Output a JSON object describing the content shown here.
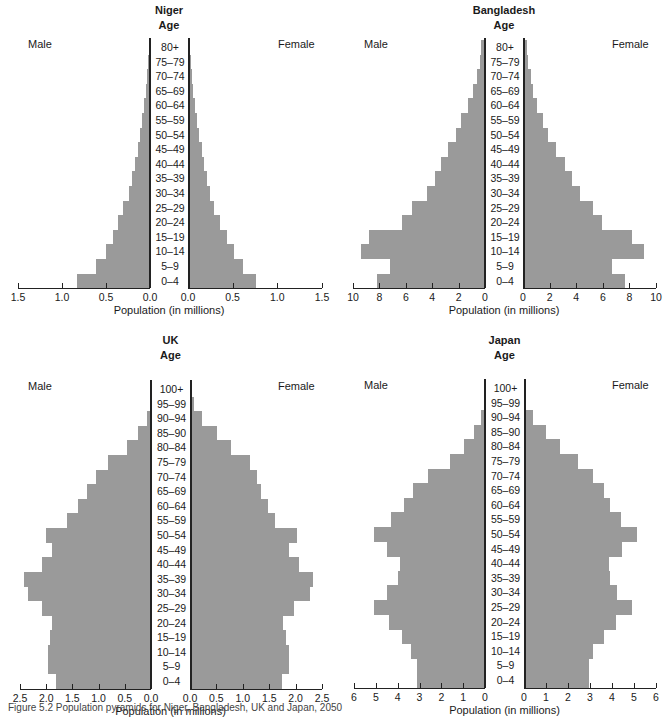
{
  "chart_data": [
    {
      "type": "bar",
      "orientation": "horizontal",
      "subtype": "population-pyramid",
      "title": "Niger",
      "age_label": "Age",
      "left_label": "Male",
      "right_label": "Female",
      "xlabel": "Population (in millions)",
      "xlim": [
        0,
        1.5
      ],
      "xticks": [
        "1.5",
        "1.0",
        "0.5",
        "0.0"
      ],
      "xticks_right": [
        "0.0",
        "0.5",
        "1.0",
        "1.5"
      ],
      "categories": [
        "80+",
        "75–79",
        "70–74",
        "65–69",
        "60–64",
        "55–59",
        "50–54",
        "45–49",
        "40–44",
        "35–39",
        "30–34",
        "25–29",
        "20–24",
        "15–19",
        "10–14",
        "5–9",
        "0–4"
      ],
      "series": [
        {
          "name": "Male",
          "values": [
            0.01,
            0.02,
            0.03,
            0.05,
            0.07,
            0.09,
            0.11,
            0.14,
            0.17,
            0.2,
            0.24,
            0.31,
            0.36,
            0.42,
            0.5,
            0.61,
            0.83,
            1.06
          ]
        },
        {
          "name": "Female",
          "values": [
            0.01,
            0.02,
            0.03,
            0.05,
            0.07,
            0.09,
            0.11,
            0.14,
            0.17,
            0.2,
            0.24,
            0.28,
            0.35,
            0.43,
            0.5,
            0.61,
            0.75,
            1.0
          ]
        }
      ]
    },
    {
      "type": "bar",
      "orientation": "horizontal",
      "subtype": "population-pyramid",
      "title": "Bangladesh",
      "age_label": "Age",
      "left_label": "Male",
      "right_label": "Female",
      "xlabel": "Population (in millions)",
      "xlim": [
        0,
        10
      ],
      "xticks": [
        "10",
        "8",
        "6",
        "4",
        "2",
        "0"
      ],
      "xticks_right": [
        "0",
        "2",
        "4",
        "6",
        "8",
        "10"
      ],
      "categories": [
        "80+",
        "75–79",
        "70–74",
        "65–69",
        "60–64",
        "55–59",
        "50–54",
        "45–49",
        "40–44",
        "35–39",
        "30–34",
        "25–29",
        "20–24",
        "15–19",
        "10–14",
        "5–9",
        "0–4"
      ],
      "series": [
        {
          "name": "Male",
          "values": [
            0.3,
            0.4,
            0.6,
            0.9,
            1.3,
            1.8,
            2.2,
            2.8,
            3.3,
            3.8,
            4.4,
            5.5,
            6.3,
            8.8,
            9.4,
            7.2,
            8.2
          ]
        },
        {
          "name": "Female",
          "values": [
            0.2,
            0.3,
            0.5,
            0.7,
            1.0,
            1.4,
            1.8,
            2.4,
            3.1,
            3.6,
            4.2,
            5.2,
            5.9,
            8.1,
            9.0,
            6.6,
            7.6
          ]
        }
      ]
    },
    {
      "type": "bar",
      "orientation": "horizontal",
      "subtype": "population-pyramid",
      "title": "UK",
      "age_label": "Age",
      "left_label": "Male",
      "right_label": "Female",
      "xlabel": "Population (in millions)",
      "xlim": [
        0,
        2.5
      ],
      "xticks": [
        "2.5",
        "2.0",
        "1.5",
        "1.0",
        "0.5",
        "0.0"
      ],
      "xticks_right": [
        "0.0",
        "0.5",
        "1.0",
        "1.5",
        "2.0",
        "2.5"
      ],
      "categories": [
        "100+",
        "95–99",
        "90–94",
        "85–90",
        "80–84",
        "75–79",
        "70–74",
        "65–69",
        "60–64",
        "55–59",
        "50–54",
        "45–49",
        "40–44",
        "35–39",
        "30–34",
        "25–29",
        "20–24",
        "15–19",
        "10–14",
        "5–9",
        "0–4"
      ],
      "series": [
        {
          "name": "Male",
          "values": [
            0.0,
            0.02,
            0.08,
            0.24,
            0.45,
            0.82,
            1.05,
            1.22,
            1.4,
            1.6,
            2.0,
            1.88,
            2.08,
            2.42,
            2.35,
            2.08,
            1.88,
            1.92,
            1.96,
            1.96,
            1.82
          ]
        },
        {
          "name": "Female",
          "values": [
            0.0,
            0.05,
            0.2,
            0.5,
            0.75,
            1.12,
            1.25,
            1.32,
            1.45,
            1.6,
            2.0,
            1.85,
            2.05,
            2.32,
            2.25,
            1.95,
            1.75,
            1.8,
            1.85,
            1.85,
            1.72
          ]
        }
      ]
    },
    {
      "type": "bar",
      "orientation": "horizontal",
      "subtype": "population-pyramid",
      "title": "Japan",
      "age_label": "Age",
      "left_label": "Male",
      "right_label": "Female",
      "xlabel": "Population (in millions)",
      "xlim": [
        0,
        6
      ],
      "xticks": [
        "6",
        "5",
        "4",
        "3",
        "2",
        "1",
        "0"
      ],
      "xticks_right": [
        "0",
        "1",
        "2",
        "3",
        "4",
        "5",
        "6"
      ],
      "categories": [
        "100+",
        "95–99",
        "90–94",
        "85–90",
        "80–84",
        "75–79",
        "70–74",
        "65–69",
        "60–64",
        "55–59",
        "50–54",
        "45–49",
        "40–44",
        "35–39",
        "30–34",
        "25–29",
        "20–24",
        "15–19",
        "10–14",
        "5–9",
        "0–4"
      ],
      "series": [
        {
          "name": "Male",
          "values": [
            0.0,
            0.05,
            0.2,
            0.5,
            0.95,
            1.6,
            2.6,
            3.3,
            3.7,
            4.3,
            5.1,
            4.5,
            3.9,
            4.0,
            4.5,
            5.1,
            4.4,
            3.8,
            3.4,
            3.1,
            3.1
          ]
        },
        {
          "name": "Female",
          "values": [
            0.0,
            0.05,
            0.35,
            0.95,
            1.6,
            2.4,
            3.1,
            3.6,
            3.85,
            4.35,
            5.1,
            4.4,
            3.8,
            3.85,
            4.2,
            4.85,
            4.15,
            3.6,
            3.1,
            2.9,
            2.9
          ]
        }
      ]
    }
  ],
  "caption": "Figure 5.2 Population pyramids for Niger, Bangladesh, UK and Japan, 2050"
}
